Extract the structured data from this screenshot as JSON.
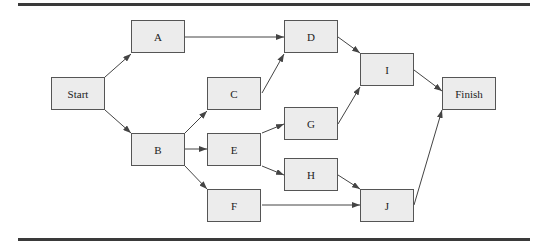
{
  "diagram": {
    "type": "network-diagram",
    "nodes": [
      {
        "id": "start",
        "label": "Start",
        "x": 51,
        "y": 77
      },
      {
        "id": "a",
        "label": "A",
        "x": 131,
        "y": 20
      },
      {
        "id": "b",
        "label": "B",
        "x": 131,
        "y": 133
      },
      {
        "id": "c",
        "label": "C",
        "x": 207,
        "y": 77
      },
      {
        "id": "d",
        "label": "D",
        "x": 284,
        "y": 20
      },
      {
        "id": "e",
        "label": "E",
        "x": 207,
        "y": 133
      },
      {
        "id": "f",
        "label": "F",
        "x": 207,
        "y": 189
      },
      {
        "id": "g",
        "label": "G",
        "x": 284,
        "y": 107
      },
      {
        "id": "h",
        "label": "H",
        "x": 284,
        "y": 158
      },
      {
        "id": "i",
        "label": "I",
        "x": 360,
        "y": 53
      },
      {
        "id": "j",
        "label": "J",
        "x": 360,
        "y": 189
      },
      {
        "id": "finish",
        "label": "Finish",
        "x": 442,
        "y": 77
      }
    ],
    "edges": [
      [
        "Start",
        "A"
      ],
      [
        "Start",
        "B"
      ],
      [
        "A",
        "D"
      ],
      [
        "B",
        "C"
      ],
      [
        "B",
        "E"
      ],
      [
        "B",
        "F"
      ],
      [
        "C",
        "D"
      ],
      [
        "D",
        "I"
      ],
      [
        "E",
        "G"
      ],
      [
        "E",
        "H"
      ],
      [
        "G",
        "I"
      ],
      [
        "H",
        "J"
      ],
      [
        "F",
        "J"
      ],
      [
        "I",
        "Finish"
      ],
      [
        "J",
        "Finish"
      ]
    ],
    "colors": {
      "box_fill": "#ececec",
      "box_border": "#555555",
      "line": "#444444",
      "rule": "#3a3a3a"
    }
  }
}
